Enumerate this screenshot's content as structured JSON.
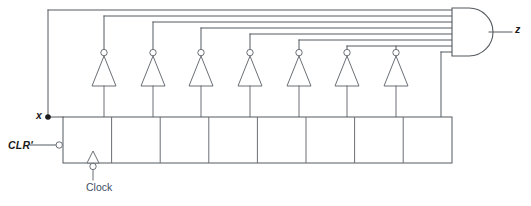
{
  "figure": {
    "name": "shift-register-sequence-detector"
  },
  "labels": {
    "input_x": "x",
    "input_clr": "CLR'",
    "clock": "Clock",
    "output_z": "z"
  },
  "colors": {
    "wire": "#555a60",
    "wire_light": "#6a6f76",
    "text": "#1b1b1b",
    "clock_text": "#3d4f63",
    "background": "#ffffff"
  },
  "circuit": {
    "register": {
      "name": "shift-register",
      "cell_count": 8,
      "x": 63,
      "y": 117,
      "width": 389,
      "height": 46,
      "cell_width": 48.6
    },
    "inverters": {
      "count": 7,
      "bubble_radius": 3.2,
      "triangle_half_width": 12,
      "triangle_height": 22,
      "apex_y": 55,
      "base_y": 87,
      "centers_x": [
        104,
        153,
        201,
        250,
        299,
        347,
        396
      ]
    },
    "and_gate": {
      "name": "and-gate",
      "input_count": 8,
      "left_x": 452,
      "top_y": 10,
      "height": 44,
      "body_width": 34
    },
    "bus_lines": {
      "count": 8,
      "y_values": [
        10,
        16,
        22,
        28,
        34,
        40,
        46,
        52
      ],
      "risers_x": [
        48,
        104,
        153,
        201,
        250,
        299,
        347,
        441
      ]
    },
    "clock": {
      "name": "clock-input",
      "triangle_x": 93,
      "triangle_base_y": 163,
      "triangle_width": 13,
      "triangle_height": 12,
      "bubble_y": 167,
      "lead_bottom_y": 180
    },
    "x_input": {
      "junction_x": 48,
      "junction_y": 117,
      "lead_from_x": 55
    },
    "clr_input": {
      "bubble_x": 59,
      "bubble_y": 145,
      "lead_from_x": 30
    },
    "z_output": {
      "from_x": 486,
      "to_x": 512,
      "y": 32
    }
  }
}
